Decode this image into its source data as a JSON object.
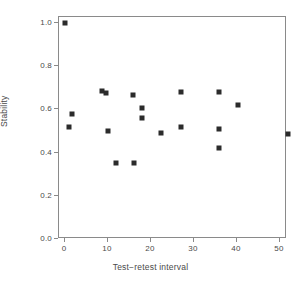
{
  "chart_data": {
    "type": "scatter",
    "title": "",
    "xlabel": "Test−retest interval",
    "ylabel": "Stability",
    "xlim": [
      -2,
      55
    ],
    "ylim": [
      0.0,
      1.03
    ],
    "grid": false,
    "legend": null,
    "marker": "square",
    "marker_color": "#2b2b2b",
    "xticks": [
      0,
      10,
      20,
      30,
      40,
      50
    ],
    "xtick_labels": [
      "0",
      "10",
      "20",
      "30",
      "40",
      "50"
    ],
    "yticks": [
      0.0,
      0.2,
      0.4,
      0.6,
      0.8,
      1.0
    ],
    "ytick_labels": [
      "0.0",
      "0.2",
      "0.4",
      "0.6",
      "0.8",
      "1.0"
    ],
    "points": [
      {
        "x": 0.0,
        "y": 1.0
      },
      {
        "x": 1.7,
        "y": 0.58
      },
      {
        "x": 1.0,
        "y": 0.52
      },
      {
        "x": 8.6,
        "y": 0.685
      },
      {
        "x": 9.6,
        "y": 0.675
      },
      {
        "x": 9.9,
        "y": 0.5
      },
      {
        "x": 11.8,
        "y": 0.35
      },
      {
        "x": 15.8,
        "y": 0.665
      },
      {
        "x": 16.0,
        "y": 0.35
      },
      {
        "x": 17.9,
        "y": 0.605
      },
      {
        "x": 17.9,
        "y": 0.56
      },
      {
        "x": 22.3,
        "y": 0.49
      },
      {
        "x": 26.9,
        "y": 0.68
      },
      {
        "x": 26.9,
        "y": 0.52
      },
      {
        "x": 35.7,
        "y": 0.68
      },
      {
        "x": 35.7,
        "y": 0.51
      },
      {
        "x": 35.7,
        "y": 0.42
      },
      {
        "x": 40.3,
        "y": 0.62
      },
      {
        "x": 51.9,
        "y": 0.485
      }
    ]
  },
  "axes": {
    "x_label": "Test−retest interval",
    "y_label": "Stability"
  },
  "style": {
    "frame_color": "#8a8a8a",
    "marker_color": "#2b2b2b",
    "text_color": "#4a4a4a",
    "background": "#ffffff"
  }
}
